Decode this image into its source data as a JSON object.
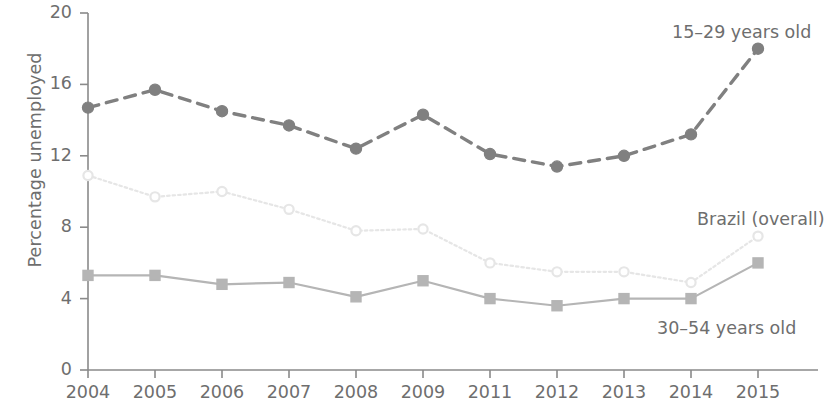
{
  "chart_data": {
    "type": "line",
    "title": "",
    "subtitle": "",
    "xlabel": "",
    "ylabel": "Percentage unemployed",
    "categories": [
      "2004",
      "2005",
      "2006",
      "2007",
      "2008",
      "2009",
      "2011",
      "2012",
      "2013",
      "2014",
      "2015"
    ],
    "x_tick_labels": [
      "2004",
      "2005",
      "2006",
      "2007",
      "2008",
      "2009",
      "2011",
      "2012",
      "2013",
      "2014",
      "2015"
    ],
    "y_tick_labels": [
      "0",
      "4",
      "8",
      "12",
      "16",
      "20"
    ],
    "y_ticks": [
      0,
      4,
      8,
      12,
      16,
      20
    ],
    "ylim": [
      0,
      20
    ],
    "grid": false,
    "legend_position": "inline-annotations",
    "series": [
      {
        "name": "15-29 years old",
        "label": "15–29 years old",
        "color": "#808080",
        "line_style": "dashed",
        "marker": "circle",
        "values": [
          14.7,
          15.7,
          14.5,
          13.7,
          12.4,
          14.3,
          12.1,
          11.4,
          12.0,
          13.2,
          18.0
        ]
      },
      {
        "name": "Brazil (overall)",
        "label": "Brazil (overall)",
        "color": "#e6e6e6",
        "line_style": "dotted",
        "marker": "open-circle",
        "values": [
          10.9,
          9.7,
          10.0,
          9.0,
          7.8,
          7.9,
          6.0,
          5.5,
          5.5,
          4.9,
          7.5
        ]
      },
      {
        "name": "30-54 years old",
        "label": "30–54 years old",
        "color": "#b5b5b5",
        "line_style": "solid",
        "marker": "square",
        "values": [
          5.3,
          5.3,
          4.8,
          4.9,
          4.1,
          5.0,
          4.0,
          3.6,
          4.0,
          4.0,
          6.0
        ]
      }
    ],
    "annotations": [
      {
        "text": "15–29 years old",
        "x_px": 672,
        "y_px": 22
      },
      {
        "text": "Brazil (overall)",
        "x_px": 697,
        "y_px": 209
      },
      {
        "text": "30–54 years old",
        "x_px": 657,
        "y_px": 318
      }
    ],
    "colors": {
      "axis": "#8a8a8a",
      "text": "#6e6e6e",
      "series_youth": "#808080",
      "series_overall": "#e6e6e6",
      "series_adult": "#b5b5b5",
      "background": "#ffffff"
    }
  }
}
